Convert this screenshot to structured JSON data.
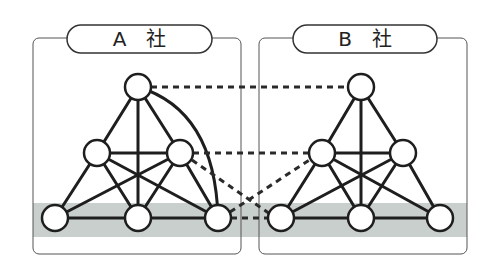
{
  "diagram": {
    "band_color": "#c9cfcc",
    "line_color": "#1e1e1e",
    "companies": [
      {
        "id": "A",
        "label": "A　社"
      },
      {
        "id": "B",
        "label": "B　社"
      }
    ],
    "nodes_per_company": [
      "top",
      "middle-left",
      "middle-right",
      "bottom-left",
      "bottom-center",
      "bottom-right"
    ],
    "internal_links": "fully connected (all node pairs linked)",
    "cross_links_dashed": [
      {
        "from": "A.top",
        "to": "B.top"
      },
      {
        "from": "A.middle-right",
        "to": "B.middle-left"
      },
      {
        "from": "A.middle-right",
        "to": "B.bottom-left"
      },
      {
        "from": "A.bottom-right",
        "to": "B.middle-left"
      },
      {
        "from": "A.bottom-right",
        "to": "B.bottom-left"
      }
    ],
    "highlight_band": "bottom tier nodes of both companies"
  }
}
